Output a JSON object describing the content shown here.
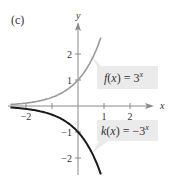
{
  "panel_label": "(c)",
  "colors": {
    "axis": "#8a8a8a",
    "f_curve": "#9a9a9a",
    "k_curve": "#1a1a1a",
    "label_bg": "#ebebeb",
    "text": "#333333"
  },
  "chart_data": {
    "type": "line",
    "title": "(c)",
    "xlabel": "x",
    "ylabel": "y",
    "xlim": [
      -2.0,
      2.9
    ],
    "ylim": [
      -2.7,
      3.2
    ],
    "x_ticks": [
      -2,
      -1,
      1,
      2
    ],
    "x_tick_labels": [
      "-2",
      "",
      "1",
      "2"
    ],
    "y_ticks": [
      -2,
      -1,
      1,
      2
    ],
    "y_tick_labels": [
      "-2",
      "-1",
      "1",
      "2"
    ],
    "grid": false,
    "series": [
      {
        "name": "f(x) = 3^x",
        "label": "f(x) = 3",
        "exponent": "x",
        "color": "#9a9a9a",
        "x": [
          -2.0,
          -1.5,
          -1.0,
          -0.5,
          0.0,
          0.25,
          0.5,
          0.75,
          0.88
        ],
        "values": [
          0.11,
          0.19,
          0.33,
          0.58,
          1.0,
          1.32,
          1.73,
          2.28,
          2.63
        ]
      },
      {
        "name": "k(x) = -3^x",
        "label": "k(x) = −3",
        "exponent": "x",
        "color": "#1a1a1a",
        "x": [
          -2.0,
          -1.5,
          -1.0,
          -0.5,
          0.0,
          0.25,
          0.5,
          0.75,
          0.88
        ],
        "values": [
          -0.11,
          -0.19,
          -0.33,
          -0.58,
          -1.0,
          -1.32,
          -1.73,
          -2.28,
          -2.63
        ]
      }
    ]
  }
}
